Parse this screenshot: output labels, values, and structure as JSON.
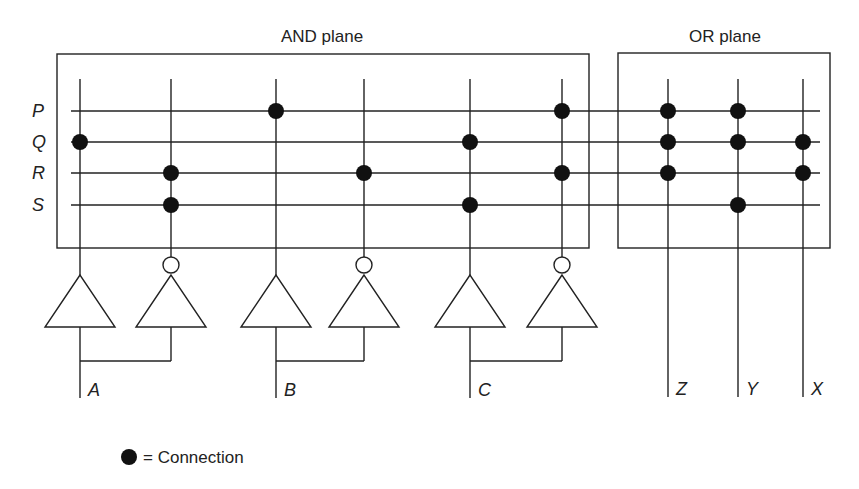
{
  "diagram": {
    "and_plane_label": "AND plane",
    "or_plane_label": "OR plane",
    "rows": [
      {
        "label": "P",
        "y": 111
      },
      {
        "label": "Q",
        "y": 142
      },
      {
        "label": "R",
        "y": 173
      },
      {
        "label": "S",
        "y": 205
      }
    ],
    "and_columns": [
      {
        "x": 80,
        "dots": [
          "Q"
        ]
      },
      {
        "x": 171,
        "dots": [
          "R",
          "S"
        ]
      },
      {
        "x": 276,
        "dots": [
          "P"
        ]
      },
      {
        "x": 364,
        "dots": [
          "R"
        ]
      },
      {
        "x": 470,
        "dots": [
          "Q",
          "S"
        ]
      },
      {
        "x": 562,
        "dots": [
          "P",
          "R"
        ]
      }
    ],
    "or_columns": [
      {
        "x": 668,
        "label": "Z",
        "dots": [
          "P",
          "Q",
          "R"
        ]
      },
      {
        "x": 738,
        "label": "Y",
        "dots": [
          "P",
          "Q",
          "S"
        ]
      },
      {
        "x": 803,
        "label": "X",
        "dots": [
          "Q",
          "R"
        ]
      }
    ],
    "inputs": [
      {
        "label": "A",
        "buf_x": 80,
        "inv_x": 171
      },
      {
        "label": "B",
        "buf_x": 276,
        "inv_x": 364
      },
      {
        "label": "C",
        "buf_x": 470,
        "inv_x": 562
      }
    ],
    "legend": {
      "symbol": "●",
      "text": "= Connection"
    }
  }
}
